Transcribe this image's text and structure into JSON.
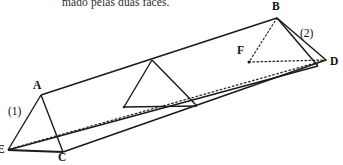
{
  "caption": {
    "text": "mado pelas duas faces."
  },
  "figure": {
    "name": "triangular-prism-diagram",
    "stroke_color": "#1a1a1a",
    "dotted_color": "#2a2a2a",
    "background": "#ffffff",
    "vertices": [
      {
        "id": "A",
        "label": "A",
        "x": 41,
        "y": 95,
        "label_x": 33,
        "label_y": 79
      },
      {
        "id": "B",
        "label": "B",
        "x": 277,
        "y": 18,
        "label_x": 272,
        "label_y": 0
      },
      {
        "id": "C",
        "label": "C",
        "x": 63,
        "y": 152,
        "label_x": 58,
        "label_y": 151
      },
      {
        "id": "D",
        "label": "D",
        "x": 326,
        "y": 60,
        "label_x": 330,
        "label_y": 55
      },
      {
        "id": "E",
        "label": "E",
        "x": 8,
        "y": 150,
        "label_x": -3,
        "label_y": 143
      },
      {
        "id": "F",
        "label": "F",
        "x": 249,
        "y": 62,
        "label_x": 237,
        "label_y": 44
      }
    ],
    "markers": [
      {
        "id": "1",
        "label": "(1)",
        "x": 8,
        "y": 105
      },
      {
        "id": "2",
        "label": "(2)",
        "x": 300,
        "y": 27
      }
    ]
  }
}
